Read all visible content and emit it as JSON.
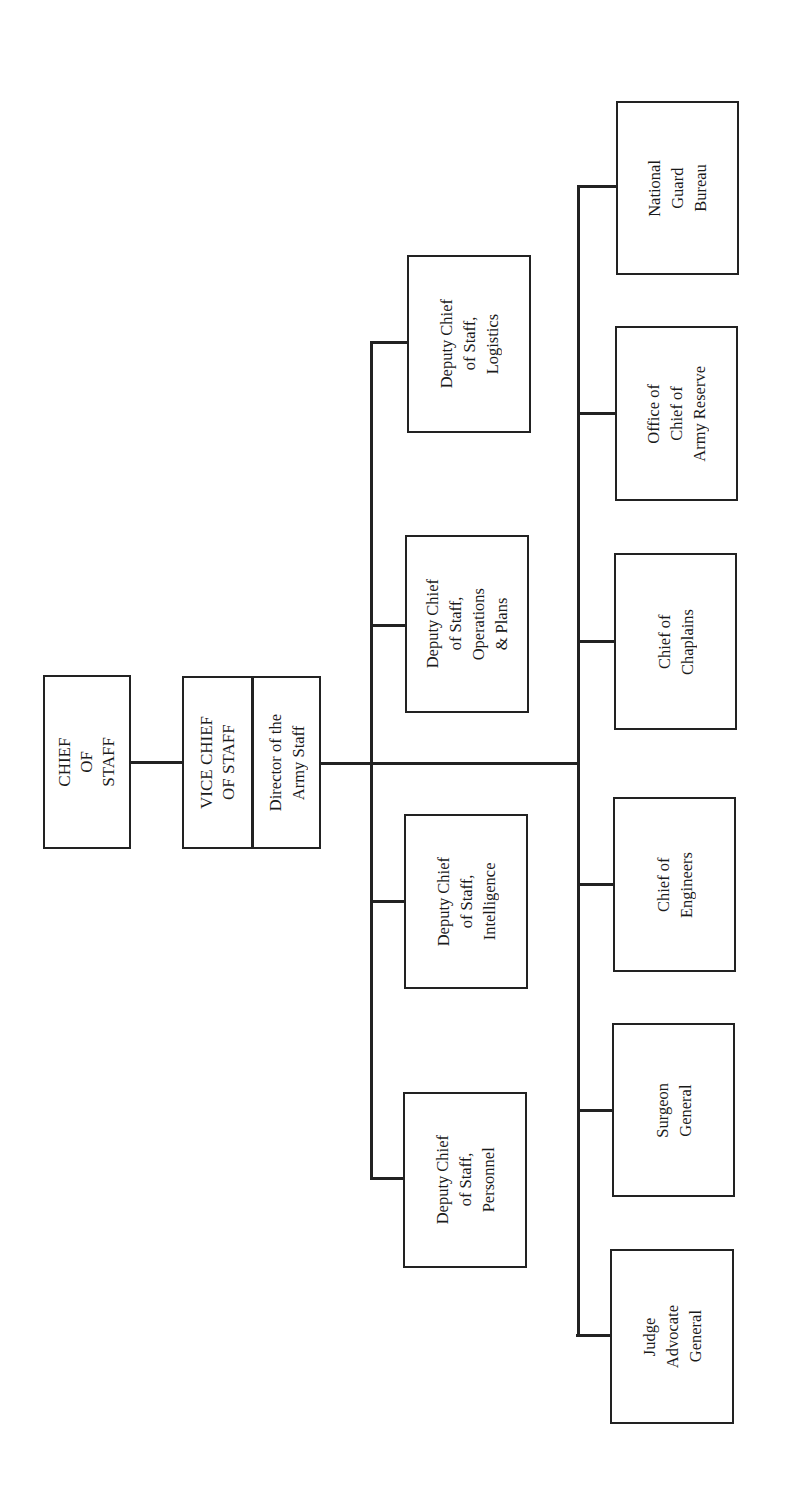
{
  "chart": {
    "orientation": "rotated-90-ccw",
    "nodes": {
      "chief_of_staff": "CHIEF\nOF\nSTAFF",
      "vice_chief_of_staff": "VICE CHIEF\nOF STAFF",
      "director_army_staff": "Director of the\nArmy Staff",
      "dcs_logistics": "Deputy Chief\nof Staff,\nLogistics",
      "dcs_operations_plans": "Deputy Chief\nof Staff,\nOperations\n& Plans",
      "dcs_intelligence": "Deputy Chief\nof Staff,\nIntelligence",
      "dcs_personnel": "Deputy Chief\nof Staff,\nPersonnel",
      "national_guard_bureau": "National\nGuard\nBureau",
      "office_chief_army_reserve": "Office of\nChief of\nArmy Reserve",
      "chief_of_chaplains": "Chief of\nChaplains",
      "chief_of_engineers": "Chief of\nEngineers",
      "surgeon_general": "Surgeon\nGeneral",
      "judge_advocate_general": "Judge\nAdvocate\nGeneral"
    },
    "hierarchy": {
      "root": "chief_of_staff",
      "level_2": [
        "vice_chief_of_staff",
        "director_army_staff"
      ],
      "deputy_chiefs": [
        "dcs_logistics",
        "dcs_operations_plans",
        "dcs_intelligence",
        "dcs_personnel"
      ],
      "special_staff": [
        "national_guard_bureau",
        "office_chief_army_reserve",
        "chief_of_chaplains",
        "chief_of_engineers",
        "surgeon_general",
        "judge_advocate_general"
      ]
    },
    "colors": {
      "line": "#222222",
      "background": "#ffffff",
      "text": "#1a1a1a"
    }
  }
}
